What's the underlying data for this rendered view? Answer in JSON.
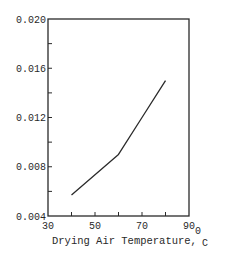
{
  "chart_data": {
    "type": "line",
    "title": "",
    "xlabel": "Drying Air Temperature,",
    "xlabel_unit_main": "0",
    "xlabel_unit_sub": "C",
    "ylabel": "",
    "xlim": [
      30,
      90
    ],
    "ylim": [
      0.004,
      0.02
    ],
    "x_tick_labels": [
      "30",
      "50",
      "70",
      "90"
    ],
    "x_tick_values_minor": [
      40,
      50,
      60,
      70,
      80
    ],
    "y_tick_labels": [
      "0.020",
      "0.016",
      "0.012",
      "0.008",
      "0.004"
    ],
    "y_tick_values_minor": [
      0.006,
      0.008,
      0.01,
      0.012,
      0.014,
      0.016,
      0.018
    ],
    "grid": false,
    "legend": null,
    "series": [
      {
        "name": "",
        "x": [
          40,
          60,
          70,
          80
        ],
        "y": [
          0.0057,
          0.009,
          0.012,
          0.015
        ]
      }
    ]
  },
  "colors": {
    "line": "#2a2a2a",
    "axis": "#2a2a2a",
    "background": "#ffffff"
  }
}
